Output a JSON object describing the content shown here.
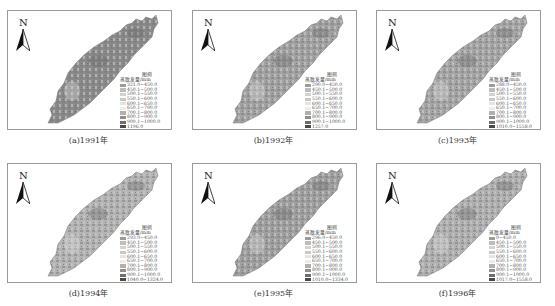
{
  "figure": {
    "legend_title": "图例",
    "legend_subtitle": "蒸散发量/mm",
    "north_label": "N",
    "panels": [
      {
        "caption": "(a)1991年",
        "map_tone": "#8a8a8a",
        "classes": [
          "321.0~450.0",
          "450.1~500.0",
          "500.1~550.0",
          "550.1~600.0",
          "600.1~650.0",
          "650.1~700.0",
          "700.1~800.0",
          "800.1~900.0",
          "900.1~1000.0",
          "1196.0"
        ]
      },
      {
        "caption": "(b)1992年",
        "map_tone": "#a2a2a2",
        "classes": [
          "290.0~450.0",
          "450.1~500.0",
          "500.1~550.0",
          "550.1~600.0",
          "600.1~650.0",
          "650.1~700.0",
          "700.1~800.0",
          "800.1~900.0",
          "900.1~1000.0",
          "1257.0"
        ]
      },
      {
        "caption": "(c)1993年",
        "map_tone": "#a6a6a6",
        "classes": [
          "288.0~450.0",
          "450.1~500.0",
          "500.1~550.0",
          "550.1~600.0",
          "600.1~650.0",
          "650.1~700.0",
          "700.1~800.0",
          "800.1~900.0",
          "900.1~1000.0",
          "1010.0~1558.0"
        ]
      },
      {
        "caption": "(d)1994年",
        "map_tone": "#b4b4b4",
        "classes": [
          "293.0~450.0",
          "450.1~500.0",
          "500.1~550.0",
          "550.1~600.0",
          "600.1~650.0",
          "650.1~700.0",
          "700.1~800.0",
          "800.1~900.0",
          "900.1~1000.0",
          "1040.0~1324.0"
        ]
      },
      {
        "caption": "(e)1995年",
        "map_tone": "#a0a0a0",
        "classes": [
          "296.0~450.0",
          "450.1~500.0",
          "500.1~550.0",
          "550.1~600.0",
          "600.1~650.0",
          "650.1~700.0",
          "700.1~800.0",
          "800.1~900.0",
          "900.1~1000.0",
          "1010.0~1334.0"
        ]
      },
      {
        "caption": "(f)1996年",
        "map_tone": "#b0b0b0",
        "classes": [
          "0~450.0",
          "450.1~500.0",
          "500.1~550.0",
          "550.1~600.0",
          "600.1~650.0",
          "650.1~700.0",
          "700.1~800.0",
          "800.1~900.0",
          "900.1~1000.0",
          "1017.0~1558.0"
        ]
      }
    ],
    "swatch_colors": [
      "#9c9c9c",
      "#bdbdbd",
      "#d2d2d2",
      "#c8c8c8",
      "#e4e4e4",
      "#ececec",
      "#b0b0b0",
      "#8f8f8f",
      "#6e6e6e",
      "#4a4a4a"
    ]
  }
}
